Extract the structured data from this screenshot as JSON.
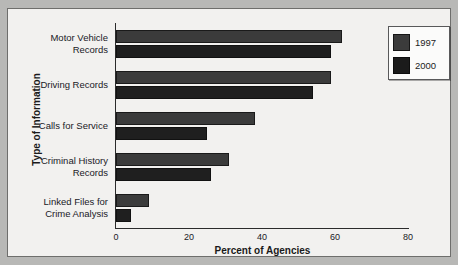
{
  "chart_data": {
    "type": "bar",
    "orientation": "horizontal",
    "title": "",
    "xlabel": "Percent of Agencies",
    "ylabel": "Type of Information",
    "xlim": [
      0,
      80
    ],
    "xticks": [
      "0",
      "20",
      "40",
      "60",
      "80"
    ],
    "grid": false,
    "legend_position": "top-right",
    "categories": [
      "Motor Vehicle Records",
      "Driving Records",
      "Calls for Service",
      "Criminal History Records",
      "Linked Files for Crime Analysis"
    ],
    "category_lines": [
      [
        "Motor Vehicle",
        "Records"
      ],
      [
        "Driving Records"
      ],
      [
        "Calls for Service"
      ],
      [
        "Criminal History",
        "Records"
      ],
      [
        "Linked Files for",
        "Crime Analysis"
      ]
    ],
    "series": [
      {
        "name": "1997",
        "color": "#3b3b3b",
        "values": [
          62,
          59,
          38,
          31,
          9
        ]
      },
      {
        "name": "2000",
        "color": "#1b1b1b",
        "values": [
          59,
          54,
          25,
          26,
          4
        ]
      }
    ]
  },
  "legend": {
    "entries": [
      {
        "label": "1997",
        "swatch": "1997-swatch"
      },
      {
        "label": "2000",
        "swatch": "2000-swatch"
      }
    ]
  }
}
